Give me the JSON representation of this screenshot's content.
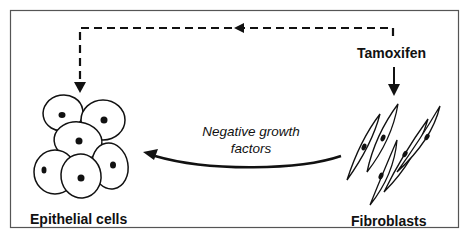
{
  "diagram": {
    "nodes": {
      "tamoxifen": {
        "label": "Tamoxifen"
      },
      "fibroblasts": {
        "label": "Fibroblasts"
      },
      "epithelial": {
        "label": "Epithelial cells"
      }
    },
    "edges": {
      "negative_growth": {
        "label_line1": "Negative growth",
        "label_line2": "factors",
        "style": "solid curved"
      },
      "tamoxifen_to_epithelial": {
        "style": "dashed"
      },
      "tamoxifen_to_fibroblasts": {
        "style": "solid"
      }
    },
    "colors": {
      "stroke": "#111111",
      "background": "#ffffff",
      "border": "#555555"
    }
  }
}
